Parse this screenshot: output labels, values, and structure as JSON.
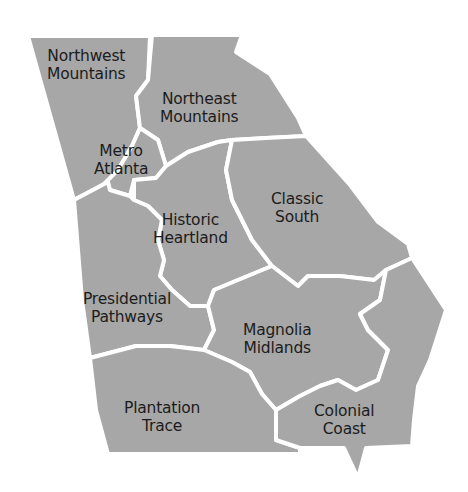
{
  "map": {
    "title": "Georgia Travel Regions",
    "fill_color": "#a7a7a7",
    "border_color": "#ffffff",
    "label_color": "#1c1c1c",
    "regions": [
      {
        "id": "northwest-mountains",
        "line1": "Northwest",
        "line2": "Mountains"
      },
      {
        "id": "northeast-mountains",
        "line1": "Northeast",
        "line2": "Mountains"
      },
      {
        "id": "metro-atlanta",
        "line1": "Metro",
        "line2": "Atlanta"
      },
      {
        "id": "historic-heartland",
        "line1": "Historic",
        "line2": "Heartland"
      },
      {
        "id": "classic-south",
        "line1": "Classic",
        "line2": "South"
      },
      {
        "id": "presidential-pathways",
        "line1": "Presidential",
        "line2": "Pathways"
      },
      {
        "id": "magnolia-midlands",
        "line1": "Magnolia",
        "line2": "Midlands"
      },
      {
        "id": "plantation-trace",
        "line1": "Plantation",
        "line2": "Trace"
      },
      {
        "id": "colonial-coast",
        "line1": "Colonial",
        "line2": "Coast"
      }
    ]
  }
}
